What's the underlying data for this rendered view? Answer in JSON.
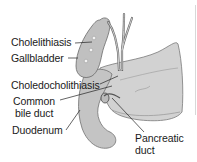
{
  "diagram": {
    "labels": {
      "cholelithiasis": "Cholelithiasis",
      "gallbladder": "Gallbladder",
      "choledocholithiasis": "Choledocholithiasis",
      "common_bile_duct_1": "Common",
      "common_bile_duct_2": "bile duct",
      "duodenum": "Duodenum",
      "pancreatic_duct_1": "Pancreatic",
      "pancreatic_duct_2": "duct"
    },
    "colors": {
      "organ_fill": "#c8c8c8",
      "organ_light": "#dcdcdc",
      "outline": "#6e6e6e",
      "text": "#1a1a1a",
      "leader": "#222222"
    }
  }
}
